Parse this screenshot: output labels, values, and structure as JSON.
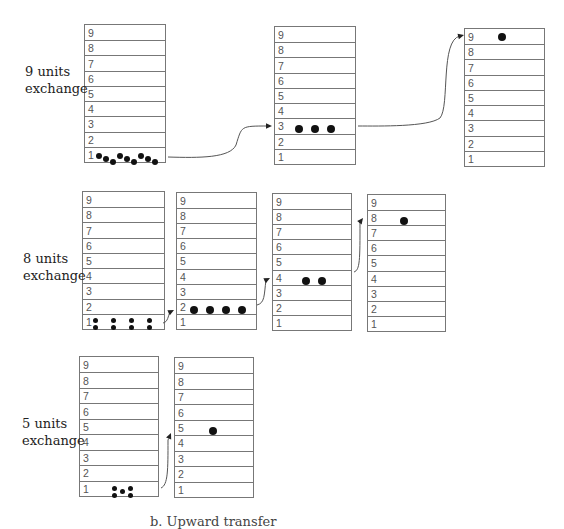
{
  "diagram": {
    "rows": [
      {
        "label_line1": "9 units",
        "label_line2": "exchange",
        "label_pos": {
          "x": 25,
          "y": 63
        },
        "stacks": [
          {
            "x": 84,
            "y": 24,
            "w": 82,
            "h": 139,
            "occupied_level": 1,
            "dots": [
              {
                "x": 14,
                "y": 4,
                "r": 3
              },
              {
                "x": 21,
                "y": 7,
                "r": 3
              },
              {
                "x": 28,
                "y": 10,
                "r": 3
              },
              {
                "x": 35,
                "y": 4,
                "r": 3
              },
              {
                "x": 42,
                "y": 7,
                "r": 3
              },
              {
                "x": 49,
                "y": 10,
                "r": 3
              },
              {
                "x": 56,
                "y": 4,
                "r": 3
              },
              {
                "x": 63,
                "y": 7,
                "r": 3
              },
              {
                "x": 70,
                "y": 10,
                "r": 3
              }
            ]
          },
          {
            "x": 274,
            "y": 26,
            "w": 82,
            "h": 139,
            "occupied_level": 3,
            "dots": [
              {
                "x": 24,
                "y": 5,
                "r": 4
              },
              {
                "x": 40,
                "y": 5,
                "r": 4
              },
              {
                "x": 56,
                "y": 5,
                "r": 4
              }
            ]
          },
          {
            "x": 464,
            "y": 28,
            "w": 81,
            "h": 139,
            "occupied_level": 9,
            "dots": [
              {
                "x": 37,
                "y": 3,
                "r": 4
              }
            ]
          }
        ]
      },
      {
        "label_line1": "8 units",
        "label_line2": "exchange",
        "label_pos": {
          "x": 23,
          "y": 250
        },
        "stacks": [
          {
            "x": 82,
            "y": 191,
            "w": 83,
            "h": 139,
            "occupied_level": 1,
            "dots": [
              {
                "x": 12,
                "y": 2,
                "r": 2.5
              },
              {
                "x": 12,
                "y": 9,
                "r": 2.5
              },
              {
                "x": 30,
                "y": 2,
                "r": 2.5
              },
              {
                "x": 30,
                "y": 9,
                "r": 2.5
              },
              {
                "x": 48,
                "y": 2,
                "r": 2.5
              },
              {
                "x": 48,
                "y": 9,
                "r": 2.5
              },
              {
                "x": 66,
                "y": 2,
                "r": 2.5
              },
              {
                "x": 66,
                "y": 9,
                "r": 2.5
              }
            ]
          },
          {
            "x": 176,
            "y": 192,
            "w": 81,
            "h": 138,
            "occupied_level": 2,
            "dots": [
              {
                "x": 17,
                "y": 5,
                "r": 4
              },
              {
                "x": 33,
                "y": 5,
                "r": 4
              },
              {
                "x": 49,
                "y": 5,
                "r": 4
              },
              {
                "x": 65,
                "y": 5,
                "r": 4
              }
            ]
          },
          {
            "x": 272,
            "y": 193,
            "w": 80,
            "h": 138,
            "occupied_level": 4,
            "dots": [
              {
                "x": 33,
                "y": 5,
                "r": 4
              },
              {
                "x": 49,
                "y": 5,
                "r": 4
              }
            ]
          },
          {
            "x": 367,
            "y": 194,
            "w": 79,
            "h": 138,
            "occupied_level": 8,
            "dots": [
              {
                "x": 36,
                "y": 5,
                "r": 4
              }
            ]
          }
        ]
      },
      {
        "label_line1": "5 units",
        "label_line2": "exchange",
        "label_pos": {
          "x": 22,
          "y": 415
        },
        "stacks": [
          {
            "x": 79,
            "y": 356,
            "w": 80,
            "h": 141,
            "occupied_level": 1,
            "dots": [
              {
                "x": 34,
                "y": 3,
                "r": 2.5
              },
              {
                "x": 34,
                "y": 10,
                "r": 2.5
              },
              {
                "x": 42,
                "y": 6,
                "r": 2.5
              },
              {
                "x": 50,
                "y": 3,
                "r": 2.5
              },
              {
                "x": 50,
                "y": 10,
                "r": 2.5
              }
            ]
          },
          {
            "x": 174,
            "y": 357,
            "w": 80,
            "h": 141,
            "occupied_level": 5,
            "dots": [
              {
                "x": 38,
                "y": 5,
                "r": 4
              }
            ]
          }
        ]
      }
    ],
    "level_labels": [
      "9",
      "8",
      "7",
      "6",
      "5",
      "4",
      "3",
      "2",
      "1"
    ],
    "arrows": [
      {
        "d": "M168,157 C200,158 230,158 236,145 C242,126 240,126 268,126",
        "tip": {
          "x": 272,
          "y": 126
        }
      },
      {
        "d": "M358,126 C380,126 428,127 440,118 C450,106 440,40 460,36",
        "tip": {
          "x": 464,
          "y": 35
        }
      },
      {
        "d": "M163,323 C168,322 168,316 170,312",
        "tip": {
          "x": 174,
          "y": 310
        }
      },
      {
        "d": "M257,305 C265,303 264,295 266,280",
        "tip": {
          "x": 270,
          "y": 278
        }
      },
      {
        "d": "M354,272 C360,270 360,260 360,222",
        "tip": {
          "x": 363,
          "y": 218
        }
      },
      {
        "d": "M161,488 C168,485 168,470 168,440",
        "tip": {
          "x": 171,
          "y": 433
        }
      }
    ],
    "caption": "b. Upward transfer",
    "colors": {
      "line": "#777777",
      "dot": "#111111",
      "text": "#222222"
    }
  }
}
